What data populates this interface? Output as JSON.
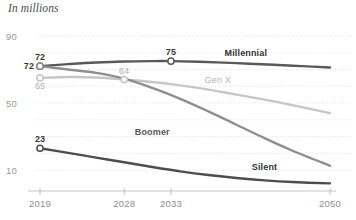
{
  "chart_data": {
    "type": "line",
    "title": "In millions",
    "xlabel": "",
    "ylabel": "",
    "xlim": [
      2019,
      2050
    ],
    "ylim": [
      0,
      95
    ],
    "grid": true,
    "grid_values": [
      90,
      80,
      70,
      60,
      50,
      40,
      30,
      20,
      10
    ],
    "legend_position": "inline-right",
    "x_ticks": [
      2019,
      2028,
      2033,
      2050
    ],
    "x_tick_labels": [
      "2019",
      "2028",
      "2033",
      "2050"
    ],
    "y_ticks": [
      90,
      50,
      10
    ],
    "y_tick_labels": [
      "90",
      "50",
      "10"
    ],
    "series": [
      {
        "name": "Millennial",
        "color": "#595959",
        "label_color": "#333333",
        "label_x": 2041,
        "label_y": 78,
        "x": [
          2019,
          2022,
          2025,
          2028,
          2031,
          2033,
          2036,
          2040,
          2044,
          2047,
          2050
        ],
        "values": [
          72,
          73.2,
          74.2,
          74.8,
          75,
          75,
          74.6,
          73.8,
          72.8,
          72.0,
          71.2
        ],
        "markers": [
          {
            "x": 2019,
            "y": 72,
            "label": "72",
            "label_pos": "left",
            "emphasis": "bold"
          },
          {
            "x": 2033,
            "y": 75,
            "label": "75",
            "label_pos": "above",
            "emphasis": "bold"
          }
        ]
      },
      {
        "name": "Gen X",
        "color": "#c6c6c6",
        "label_color": "#b4b4b4",
        "label_x": 2038,
        "label_y": 62,
        "x": [
          2019,
          2022,
          2025,
          2028,
          2031,
          2034,
          2037,
          2040,
          2044,
          2047,
          2050
        ],
        "values": [
          65,
          65.5,
          65.2,
          64,
          62.5,
          60.5,
          58,
          55,
          51,
          47.5,
          44
        ],
        "markers": [
          {
            "x": 2019,
            "y": 65,
            "label": "65",
            "label_pos": "below",
            "emphasis": "muted"
          },
          {
            "x": 2028,
            "y": 64,
            "label": "64",
            "label_pos": "above",
            "emphasis": "muted"
          }
        ]
      },
      {
        "name": "Boomer",
        "color": "#8e8e8e",
        "label_color": "#555555",
        "label_x": 2031,
        "label_y": 31,
        "x": [
          2019,
          2022,
          2025,
          2028,
          2031,
          2034,
          2037,
          2040,
          2043,
          2046,
          2050
        ],
        "values": [
          72,
          70,
          68,
          64.5,
          59,
          52.5,
          45,
          37,
          29,
          21.5,
          12.5
        ],
        "markers": [
          {
            "x": 2019,
            "y": 72,
            "label": "72",
            "label_pos": "above",
            "emphasis": "bold"
          }
        ]
      },
      {
        "name": "Silent",
        "color": "#4d4d4d",
        "label_color": "#333333",
        "label_x": 2043,
        "label_y": 10,
        "x": [
          2019,
          2022,
          2025,
          2028,
          2031,
          2034,
          2037,
          2040,
          2043,
          2046,
          2050
        ],
        "values": [
          23,
          20.2,
          17.4,
          14.6,
          11.8,
          9.2,
          7.0,
          5.2,
          3.8,
          2.8,
          2.0
        ],
        "markers": [
          {
            "x": 2019,
            "y": 23,
            "label": "23",
            "label_pos": "above",
            "emphasis": "bold"
          }
        ]
      }
    ]
  },
  "colors": {
    "millennial": "#595959",
    "genx": "#c6c6c6",
    "boomer": "#8e8e8e",
    "silent": "#4d4d4d",
    "gridline": "#d8d8d8",
    "axis": "#b8b8b8",
    "tick_text": "#8e8e8e"
  }
}
